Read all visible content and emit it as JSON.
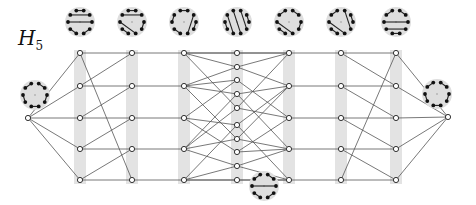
{
  "title": {
    "symbol": "H",
    "subscript": "5"
  },
  "colors": {
    "band": "#e3e3e3",
    "edge": "#555555",
    "node_fill": "#ffffff",
    "node_stroke": "#333333",
    "disk": "#dedede",
    "dot": "#111111"
  },
  "columns": [
    {
      "x": 80,
      "ys": [
        53,
        86,
        118,
        149,
        180
      ]
    },
    {
      "x": 132,
      "ys": [
        53,
        86,
        118,
        149,
        180
      ]
    },
    {
      "x": 184,
      "ys": [
        53,
        86,
        118,
        149,
        180
      ]
    },
    {
      "x": 237,
      "ys": [
        53,
        67,
        80,
        94,
        108,
        125,
        139,
        152,
        166,
        180
      ]
    },
    {
      "x": 289,
      "ys": [
        53,
        86,
        118,
        149,
        180
      ]
    },
    {
      "x": 341,
      "ys": [
        53,
        86,
        118,
        149,
        180
      ]
    },
    {
      "x": 396,
      "ys": [
        53,
        86,
        118,
        149,
        180
      ]
    }
  ],
  "endpoints": {
    "left": {
      "x": 28,
      "y": 118
    },
    "right": {
      "x": 448,
      "y": 117
    }
  },
  "disks": [
    {
      "name": "top-1",
      "cx": 80,
      "cy": 22,
      "chords": [
        [
          0,
          1
        ],
        [
          9,
          2
        ],
        [
          8,
          3
        ],
        [
          7,
          6
        ],
        [
          5,
          4
        ]
      ]
    },
    {
      "name": "top-2",
      "cx": 132,
      "cy": 22,
      "chords": [
        [
          0,
          1
        ],
        [
          9,
          2
        ],
        [
          8,
          5
        ],
        [
          7,
          6
        ],
        [
          3,
          4
        ]
      ]
    },
    {
      "name": "top-3",
      "cx": 184,
      "cy": 22,
      "chords": [
        [
          0,
          1
        ],
        [
          9,
          8
        ],
        [
          7,
          6
        ],
        [
          2,
          5
        ],
        [
          3,
          4
        ]
      ]
    },
    {
      "name": "top-4",
      "cx": 237,
      "cy": 22,
      "chords": [
        [
          0,
          5
        ],
        [
          9,
          6
        ],
        [
          8,
          7
        ],
        [
          1,
          4
        ],
        [
          2,
          3
        ]
      ]
    },
    {
      "name": "top-5",
      "cx": 289,
      "cy": 22,
      "chords": [
        [
          0,
          9
        ],
        [
          1,
          2
        ],
        [
          8,
          5
        ],
        [
          7,
          6
        ],
        [
          3,
          4
        ]
      ]
    },
    {
      "name": "top-6",
      "cx": 341,
      "cy": 22,
      "chords": [
        [
          0,
          9
        ],
        [
          1,
          4
        ],
        [
          2,
          3
        ],
        [
          8,
          5
        ],
        [
          7,
          6
        ]
      ]
    },
    {
      "name": "top-7",
      "cx": 396,
      "cy": 22,
      "chords": [
        [
          0,
          9
        ],
        [
          1,
          2
        ],
        [
          8,
          3
        ],
        [
          7,
          4
        ],
        [
          6,
          5
        ]
      ]
    },
    {
      "name": "left",
      "cx": 35,
      "cy": 95,
      "chords": [
        [
          0,
          9
        ],
        [
          1,
          2
        ],
        [
          3,
          4
        ],
        [
          5,
          6
        ],
        [
          7,
          8
        ]
      ]
    },
    {
      "name": "right",
      "cx": 437,
      "cy": 94,
      "chords": [
        [
          0,
          9
        ],
        [
          1,
          2
        ],
        [
          3,
          4
        ],
        [
          5,
          6
        ],
        [
          7,
          8
        ]
      ]
    },
    {
      "name": "bottom",
      "cx": 264,
      "cy": 186,
      "chords": [
        [
          0,
          9
        ],
        [
          1,
          2
        ],
        [
          8,
          3
        ],
        [
          4,
          5
        ],
        [
          6,
          7
        ]
      ]
    }
  ]
}
